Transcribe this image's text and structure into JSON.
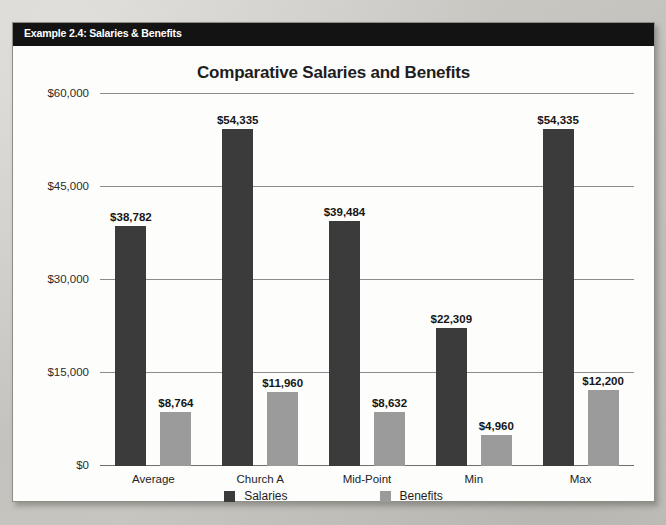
{
  "header": {
    "label": "Example 2.4: Salaries & Benefits"
  },
  "legend": {
    "items": [
      {
        "label": "Salaries",
        "color": "#3b3b3b",
        "swatch_name": "legend-swatch-salaries"
      },
      {
        "label": "Benefits",
        "color": "#9b9b9b",
        "swatch_name": "legend-swatch-benefits"
      }
    ]
  },
  "chart_data": {
    "type": "bar",
    "title": "Comparative Salaries and Benefits",
    "xlabel": "",
    "ylabel": "",
    "ylim": [
      0,
      60000
    ],
    "grid": true,
    "legend_position": "bottom",
    "ytick_labels": [
      "$0",
      "$15,000",
      "$30,000",
      "$45,000",
      "$60,000"
    ],
    "ytick_values": [
      0,
      15000,
      30000,
      45000,
      60000
    ],
    "categories": [
      "Average",
      "Church A",
      "Mid-Point",
      "Min",
      "Max"
    ],
    "series": [
      {
        "name": "Salaries",
        "color": "#3b3b3b",
        "values": [
          38782,
          54335,
          39484,
          22309,
          54335
        ],
        "labels": [
          "$38,782",
          "$54,335",
          "$39,484",
          "$22,309",
          "$54,335"
        ]
      },
      {
        "name": "Benefits",
        "color": "#9b9b9b",
        "values": [
          8764,
          11960,
          8632,
          4960,
          12200
        ],
        "labels": [
          "$8,764",
          "$11,960",
          "$8,632",
          "$4,960",
          "$12,200"
        ]
      }
    ]
  }
}
